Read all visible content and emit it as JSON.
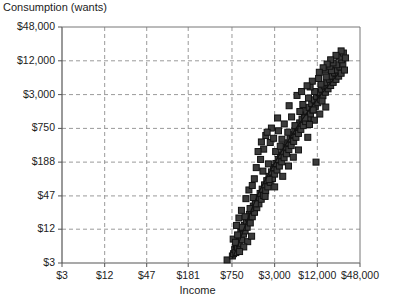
{
  "chart_data": {
    "type": "scatter",
    "title": "",
    "ylabel": "Consumption (wants)",
    "xlabel": "Income",
    "xscale": "log",
    "yscale": "log",
    "grid": true,
    "legend": null,
    "xlim": [
      3,
      48000
    ],
    "ylim": [
      3,
      48000
    ],
    "xticks": [
      3,
      12,
      47,
      181,
      750,
      3000,
      12000,
      48000
    ],
    "xtick_labels": [
      "$3",
      "$12",
      "$47",
      "$181",
      "$750",
      "$3,000",
      "$12,000",
      "$48,000"
    ],
    "yticks": [
      3,
      12,
      47,
      188,
      750,
      3000,
      12000,
      48000
    ],
    "ytick_labels": [
      "$3",
      "$12",
      "$47",
      "$188",
      "$750",
      "$3,000",
      "$12,000",
      "$48,000"
    ],
    "marker": "square",
    "marker_color": "#3b3b3b",
    "marker_edge_color": "#111111",
    "marker_size_px": 6,
    "trendline": {
      "color": "#111111",
      "width_px": 1.2,
      "points": [
        [
          760,
          3.6
        ],
        [
          900,
          6.0
        ],
        [
          1100,
          12.0
        ],
        [
          1400,
          26.0
        ],
        [
          1800,
          55.0
        ],
        [
          2400,
          110.0
        ],
        [
          3200,
          210.0
        ],
        [
          4300,
          390.0
        ],
        [
          6000,
          750.0
        ],
        [
          8500,
          1400.0
        ],
        [
          12000,
          2500.0
        ],
        [
          17000,
          4300.0
        ],
        [
          24000,
          7200.0
        ]
      ]
    },
    "points": [
      [
        640,
        3.4
      ],
      [
        760,
        4.0
      ],
      [
        790,
        4.4
      ],
      [
        820,
        5.2
      ],
      [
        850,
        4.6
      ],
      [
        870,
        6.2
      ],
      [
        900,
        5.6
      ],
      [
        930,
        7.4
      ],
      [
        950,
        6.6
      ],
      [
        980,
        8.6
      ],
      [
        1000,
        10.5
      ],
      [
        1030,
        7.8
      ],
      [
        1060,
        12.5
      ],
      [
        1090,
        9.8
      ],
      [
        1120,
        14.0
      ],
      [
        1150,
        11.2
      ],
      [
        1200,
        16.5
      ],
      [
        1230,
        13.0
      ],
      [
        1280,
        19.0
      ],
      [
        1320,
        22.0
      ],
      [
        1360,
        15.5
      ],
      [
        1400,
        26.0
      ],
      [
        1450,
        20.0
      ],
      [
        1500,
        31.0
      ],
      [
        1560,
        24.0
      ],
      [
        1620,
        36.0
      ],
      [
        1680,
        29.0
      ],
      [
        1740,
        44.0
      ],
      [
        1800,
        34.0
      ],
      [
        1870,
        52.0
      ],
      [
        1940,
        41.0
      ],
      [
        2000,
        62.0
      ],
      [
        2080,
        48.0
      ],
      [
        2160,
        74.0
      ],
      [
        2240,
        58.0
      ],
      [
        2320,
        88.0
      ],
      [
        2400,
        68.0
      ],
      [
        2500,
        105.0
      ],
      [
        2600,
        82.0
      ],
      [
        2700,
        126.0
      ],
      [
        2800,
        96.0
      ],
      [
        2900,
        150.0
      ],
      [
        3000,
        115.0
      ],
      [
        3120,
        178.0
      ],
      [
        3240,
        136.0
      ],
      [
        3360,
        210.0
      ],
      [
        3500,
        160.0
      ],
      [
        3640,
        250.0
      ],
      [
        3780,
        190.0
      ],
      [
        3920,
        295.0
      ],
      [
        4080,
        225.0
      ],
      [
        4240,
        350.0
      ],
      [
        4400,
        265.0
      ],
      [
        4580,
        415.0
      ],
      [
        4760,
        315.0
      ],
      [
        4940,
        490.0
      ],
      [
        5140,
        370.0
      ],
      [
        5340,
        580.0
      ],
      [
        5560,
        440.0
      ],
      [
        5780,
        680.0
      ],
      [
        6000,
        520.0
      ],
      [
        6240,
        800.0
      ],
      [
        6500,
        610.0
      ],
      [
        6760,
        940.0
      ],
      [
        7020,
        720.0
      ],
      [
        7300,
        1100.0
      ],
      [
        7600,
        840.0
      ],
      [
        7900,
        1300.0
      ],
      [
        8200,
        990.0
      ],
      [
        8500,
        1520.0
      ],
      [
        8850,
        1160.0
      ],
      [
        9200,
        1780.0
      ],
      [
        9600,
        1360.0
      ],
      [
        10000,
        2080.0
      ],
      [
        10400,
        1590.0
      ],
      [
        10800,
        2420.0
      ],
      [
        11250,
        1850.0
      ],
      [
        11700,
        2800.0
      ],
      [
        12200,
        2150.0
      ],
      [
        12700,
        3250.0
      ],
      [
        13200,
        2480.0
      ],
      [
        13800,
        3750.0
      ],
      [
        14400,
        2870.0
      ],
      [
        15000,
        4300.0
      ],
      [
        15600,
        3300.0
      ],
      [
        16300,
        4950.0
      ],
      [
        17000,
        3800.0
      ],
      [
        17700,
        5650.0
      ],
      [
        18500,
        4350.0
      ],
      [
        19300,
        6400.0
      ],
      [
        20100,
        4950.0
      ],
      [
        21000,
        7300.0
      ],
      [
        22000,
        5600.0
      ],
      [
        23000,
        8200.0
      ],
      [
        24000,
        6400.0
      ],
      [
        25000,
        9300.0
      ],
      [
        26000,
        7200.0
      ],
      [
        27500,
        10500.0
      ],
      [
        29000,
        8200.0
      ],
      [
        2100,
        320.0
      ],
      [
        2600,
        420.0
      ],
      [
        1650,
        150.0
      ],
      [
        2250,
        560.0
      ],
      [
        3400,
        680.0
      ],
      [
        4100,
        900.0
      ],
      [
        1900,
        210.0
      ],
      [
        2900,
        500.0
      ],
      [
        5200,
        1200.0
      ],
      [
        6800,
        1500.0
      ],
      [
        4600,
        640.0
      ],
      [
        3800,
        480.0
      ],
      [
        7500,
        2000.0
      ],
      [
        9000,
        2600.0
      ],
      [
        11000,
        3400.0
      ],
      [
        13500,
        4600.0
      ],
      [
        16000,
        6200.0
      ],
      [
        19000,
        8000.0
      ],
      [
        22500,
        10200.0
      ],
      [
        26500,
        12500.0
      ],
      [
        1300,
        60.0
      ],
      [
        1550,
        95.0
      ],
      [
        1020,
        26.0
      ],
      [
        1180,
        42.0
      ],
      [
        2050,
        130.0
      ],
      [
        2450,
        175.0
      ],
      [
        870,
        14.0
      ],
      [
        940,
        19.0
      ],
      [
        3100,
        290.0
      ],
      [
        3600,
        360.0
      ],
      [
        780,
        8.0
      ],
      [
        1450,
        72.0
      ],
      [
        5800,
        840.0
      ],
      [
        8000,
        1150.0
      ],
      [
        10500,
        1600.0
      ],
      [
        14000,
        2300.0
      ],
      [
        6200,
        2900.0
      ],
      [
        4800,
        1900.0
      ],
      [
        3300,
        1150.0
      ],
      [
        2700,
        760.0
      ],
      [
        9500,
        4100.0
      ],
      [
        12500,
        5800.0
      ],
      [
        15500,
        8200.0
      ],
      [
        18000,
        9600.0
      ],
      [
        2350,
        640.0
      ],
      [
        1950,
        430.0
      ],
      [
        1750,
        290.0
      ],
      [
        7200,
        3400.0
      ],
      [
        3000,
        68.0
      ],
      [
        3900,
        105.0
      ],
      [
        4700,
        160.0
      ],
      [
        2200,
        46.0
      ],
      [
        5500,
        230.0
      ],
      [
        1600,
        34.0
      ],
      [
        6500,
        310.0
      ],
      [
        8800,
        520.0
      ],
      [
        11500,
        188.0
      ],
      [
        1150,
        20.0
      ],
      [
        1350,
        28.0
      ],
      [
        1050,
        13.0
      ],
      [
        900,
        9.5
      ],
      [
        840,
        7.0
      ],
      [
        1500,
        44.0
      ],
      [
        2500,
        92.0
      ],
      [
        20000,
        11000.0
      ],
      [
        24500,
        14000.0
      ],
      [
        28000,
        16500.0
      ],
      [
        30000,
        13500.0
      ],
      [
        26000,
        18000.0
      ],
      [
        22000,
        15000.0
      ],
      [
        18500,
        12500.0
      ],
      [
        16500,
        10500.0
      ],
      [
        14500,
        9000.0
      ],
      [
        12800,
        7500.0
      ],
      [
        10200,
        5200.0
      ],
      [
        8600,
        4300.0
      ],
      [
        13000,
        1350.0
      ],
      [
        15800,
        1800.0
      ],
      [
        10900,
        1050.0
      ],
      [
        9300,
        880.0
      ],
      [
        1250,
        7.2
      ],
      [
        1100,
        5.8
      ],
      [
        1420,
        9.0
      ],
      [
        960,
        4.8
      ]
    ]
  }
}
